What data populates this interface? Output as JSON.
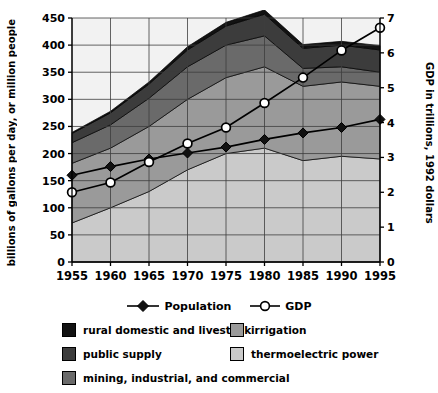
{
  "chart_data": {
    "type": "area",
    "title": "",
    "xlabel": "",
    "ylabel": "billions of gallons per day, or million people",
    "y2label": "GDP in trillions, 1992 dollars",
    "categories": [
      1955,
      1960,
      1965,
      1970,
      1975,
      1980,
      1985,
      1990,
      1995
    ],
    "xlim": [
      1955,
      1995
    ],
    "ylim": [
      0,
      450
    ],
    "y2lim": [
      0,
      7
    ],
    "yticks": [
      0,
      50,
      100,
      150,
      200,
      250,
      300,
      350,
      400,
      450
    ],
    "y2ticks": [
      0,
      1,
      2,
      3,
      4,
      5,
      6,
      7
    ],
    "xticks": [
      "1955",
      "1960",
      "1965",
      "1970",
      "1975",
      "1980",
      "1985",
      "1990",
      "1995"
    ],
    "grid": true,
    "stacked": true,
    "legend_position": "bottom",
    "series": [
      {
        "name": "thermoelectric power",
        "kind": "area",
        "color": "#cacaca",
        "values": [
          72,
          100,
          130,
          170,
          200,
          210,
          187,
          195,
          190
        ]
      },
      {
        "name": "irrigation",
        "kind": "area",
        "color": "#9a9a9a",
        "values": [
          110,
          110,
          120,
          130,
          140,
          150,
          137,
          137,
          134
        ]
      },
      {
        "name": "mining, industrial, and commercial",
        "kind": "area",
        "color": "#6a6a6a",
        "values": [
          38,
          43,
          52,
          60,
          60,
          57,
          33,
          28,
          26
        ]
      },
      {
        "name": "public supply",
        "kind": "area",
        "color": "#3c3c3c",
        "values": [
          17,
          22,
          26,
          31,
          35,
          40,
          37,
          40,
          41
        ]
      },
      {
        "name": "rural domestic and livestock",
        "kind": "area",
        "color": "#121212",
        "values": [
          2,
          3,
          4,
          6,
          7,
          8,
          7,
          7,
          8
        ]
      }
    ],
    "lines": [
      {
        "name": "Population",
        "marker": "filled-diamond",
        "axis": "left",
        "color": "#000000",
        "values": [
          160,
          176,
          190,
          201,
          212,
          226,
          238,
          248,
          263
        ]
      },
      {
        "name": "GDP",
        "marker": "open-circle",
        "axis": "right",
        "color": "#000000",
        "values": [
          2.0,
          2.28,
          2.87,
          3.4,
          3.86,
          4.56,
          5.29,
          6.07,
          6.72
        ]
      }
    ]
  },
  "legend": {
    "lines": [
      {
        "label": "Population",
        "marker": "filled-diamond"
      },
      {
        "label": "GDP",
        "marker": "open-circle"
      }
    ],
    "areas": [
      {
        "label": "rural domestic and livestock",
        "color": "#121212"
      },
      {
        "label": "irrigation",
        "color": "#9a9a9a"
      },
      {
        "label": "public supply",
        "color": "#3c3c3c"
      },
      {
        "label": "thermoelectric power",
        "color": "#cacaca"
      },
      {
        "label": "mining, industrial, and commercial",
        "color": "#6a6a6a"
      }
    ]
  }
}
